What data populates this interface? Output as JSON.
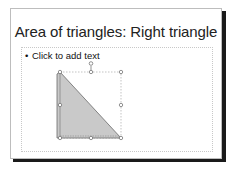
{
  "slide": {
    "title": "Area of triangles: Right triangle",
    "content_placeholder": {
      "bullet": "•",
      "text": "Click to add text"
    },
    "shape": {
      "type": "right-triangle",
      "selected": true,
      "fill_color": "#c8c8c8",
      "stroke_color": "#6a6a6a",
      "handles": [
        "top-left",
        "top-center",
        "top-right",
        "middle-left",
        "middle-right",
        "bottom-left",
        "bottom-center",
        "bottom-right"
      ],
      "rotate_handle": true
    }
  },
  "colors": {
    "slide_border": "#bdbdbd",
    "slide_shadow": "#1a1a1a",
    "placeholder_border": "#c8c8c8",
    "text": "#222222"
  }
}
